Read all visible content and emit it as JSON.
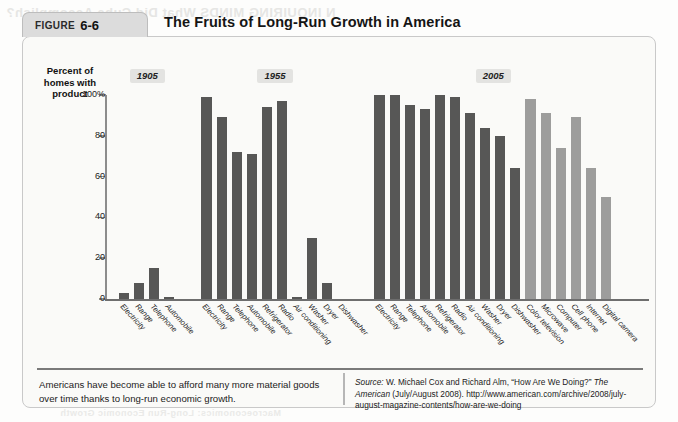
{
  "figure": {
    "tab_label": "FIGURE",
    "tab_number": "6-6",
    "title": "The Fruits of Long-Run Growth in America",
    "caption": "Americans have become able to afford many more material goods over time thanks to long-run economic growth.",
    "source_prefix": "Source:",
    "source_text": " W. Michael Cox and Richard Alm, “How Are We Doing?” ",
    "source_italic": "The American",
    "source_tail": " (July/August 2008). http://www.american.com/archive/2008/july-august-magazine-contents/how-are-we-doing"
  },
  "bleed_text": {
    "top": "N INQUIRING MINDS   What Did Cuba Accomplish?",
    "bottom": "Macroeconomics: Long-Run Economic Growth"
  },
  "colors": {
    "bar_dark": "#575756",
    "bar_light": "#9d9d9c",
    "axis": "#8c8c8c",
    "tab_bg": "#dcdcdc",
    "era_bg": "#e3e3e1",
    "panel_bg": "#fafaf8"
  },
  "chart_data": {
    "type": "bar",
    "title": "The Fruits of Long-Run Growth in America",
    "xlabel": "",
    "ylabel": "Percent of homes with product",
    "ylim": [
      0,
      100
    ],
    "yticks": [
      0,
      20,
      40,
      60,
      80,
      100
    ],
    "ytick_labels": [
      "0",
      "20",
      "40",
      "60",
      "80",
      "100%"
    ],
    "grid": false,
    "legend": "none",
    "era_labels": [
      "1905",
      "1955",
      "2005"
    ],
    "groups": [
      {
        "era": "1905",
        "bars": [
          {
            "label": "Electricity",
            "value": 3,
            "shade": "dark"
          },
          {
            "label": "Range",
            "value": 8,
            "shade": "dark"
          },
          {
            "label": "Telephone",
            "value": 15,
            "shade": "dark"
          },
          {
            "label": "Automobile",
            "value": 1,
            "shade": "dark"
          }
        ]
      },
      {
        "era": "1955",
        "bars": [
          {
            "label": "Electricity",
            "value": 99,
            "shade": "dark"
          },
          {
            "label": "Range",
            "value": 89,
            "shade": "dark"
          },
          {
            "label": "Telephone",
            "value": 72,
            "shade": "dark"
          },
          {
            "label": "Automobile",
            "value": 71,
            "shade": "dark"
          },
          {
            "label": "Refrigerator",
            "value": 94,
            "shade": "dark"
          },
          {
            "label": "Radio",
            "value": 97,
            "shade": "dark"
          },
          {
            "label": "Air conditioning",
            "value": 1,
            "shade": "dark"
          },
          {
            "label": "Washer",
            "value": 30,
            "shade": "dark"
          },
          {
            "label": "Dryer",
            "value": 8,
            "shade": "dark"
          },
          {
            "label": "Dishwasher",
            "value": 0,
            "shade": "dark"
          }
        ]
      },
      {
        "era": "2005",
        "bars": [
          {
            "label": "Electricity",
            "value": 100,
            "shade": "dark"
          },
          {
            "label": "Range",
            "value": 100,
            "shade": "dark"
          },
          {
            "label": "Telephone",
            "value": 95,
            "shade": "dark"
          },
          {
            "label": "Automobile",
            "value": 93,
            "shade": "dark"
          },
          {
            "label": "Refrigerator",
            "value": 100,
            "shade": "dark"
          },
          {
            "label": "Radio",
            "value": 99,
            "shade": "dark"
          },
          {
            "label": "Air conditioning",
            "value": 91,
            "shade": "dark"
          },
          {
            "label": "Washer",
            "value": 84,
            "shade": "dark"
          },
          {
            "label": "Dryer",
            "value": 80,
            "shade": "dark"
          },
          {
            "label": "Dishwasher",
            "value": 64,
            "shade": "dark"
          },
          {
            "label": "Color television",
            "value": 98,
            "shade": "light"
          },
          {
            "label": "Microwave",
            "value": 91,
            "shade": "light"
          },
          {
            "label": "Computer",
            "value": 74,
            "shade": "light"
          },
          {
            "label": "Cell phone",
            "value": 89,
            "shade": "light"
          },
          {
            "label": "Internet",
            "value": 64,
            "shade": "light"
          },
          {
            "label": "Digital camera",
            "value": 50,
            "shade": "light"
          }
        ]
      }
    ]
  }
}
